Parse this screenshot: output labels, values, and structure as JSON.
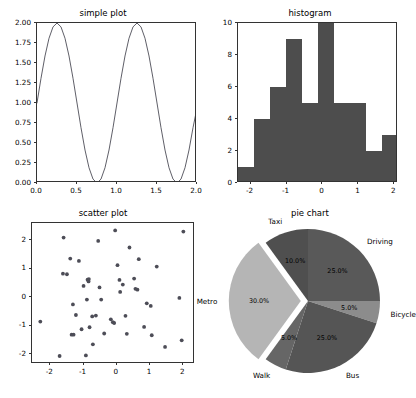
{
  "figure": {
    "width": 413,
    "height": 398,
    "background": "#ffffff"
  },
  "chart_data": [
    {
      "type": "line",
      "title": "simple plot",
      "xlabel": "",
      "ylabel": "",
      "xlim": [
        0,
        2
      ],
      "ylim": [
        0,
        2
      ],
      "xticks": [
        "0.0",
        "0.5",
        "1.0",
        "1.5",
        "2.0"
      ],
      "xtick_values": [
        0,
        0.5,
        1.0,
        1.5,
        2.0
      ],
      "yticks": [
        "0.00",
        "0.25",
        "0.50",
        "0.75",
        "1.00",
        "1.25",
        "1.50",
        "1.75",
        "2.00"
      ],
      "ytick_values": [
        0.0,
        0.25,
        0.5,
        0.75,
        1.0,
        1.25,
        1.5,
        1.75,
        2.0
      ],
      "grid": false,
      "legend": null,
      "line_color": "#4d4d57",
      "formula": "1 + sin(2*pi*x)",
      "x": [
        0.0,
        0.05,
        0.1,
        0.15,
        0.2,
        0.25,
        0.3,
        0.35,
        0.4,
        0.45,
        0.5,
        0.55,
        0.6,
        0.65,
        0.7,
        0.75,
        0.8,
        0.85,
        0.9,
        0.95,
        1.0,
        1.05,
        1.1,
        1.15,
        1.2,
        1.25,
        1.3,
        1.35,
        1.4,
        1.45,
        1.5,
        1.55,
        1.6,
        1.65,
        1.7,
        1.75,
        1.8,
        1.85,
        1.9,
        1.95,
        2.0
      ],
      "y": [
        1.0,
        1.309,
        1.588,
        1.809,
        1.951,
        2.0,
        1.951,
        1.809,
        1.588,
        1.309,
        1.0,
        0.691,
        0.412,
        0.191,
        0.049,
        0.0,
        0.049,
        0.191,
        0.412,
        0.691,
        1.0,
        1.309,
        1.588,
        1.809,
        1.951,
        2.0,
        1.951,
        1.809,
        1.588,
        1.309,
        1.0,
        0.691,
        0.412,
        0.191,
        0.049,
        0.0,
        0.049,
        0.191,
        0.412,
        0.691,
        0.938
      ]
    },
    {
      "type": "bar",
      "subtype": "histogram",
      "title": "histogram",
      "xlabel": "",
      "ylabel": "",
      "xlim": [
        -2.35,
        2.1
      ],
      "ylim": [
        0,
        10
      ],
      "xticks": [
        "-2",
        "-1",
        "0",
        "1",
        "2"
      ],
      "xtick_values": [
        -2,
        -1,
        0,
        1,
        2
      ],
      "yticks": [
        "0",
        "2",
        "4",
        "6",
        "8",
        "10"
      ],
      "ytick_values": [
        0,
        2,
        4,
        6,
        8,
        10
      ],
      "grid": false,
      "legend": null,
      "bar_color": "#4d4d4d",
      "bin_edges": [
        -2.35,
        -1.905,
        -1.46,
        -1.015,
        -0.57,
        -0.125,
        0.32,
        0.765,
        1.21,
        1.655,
        2.1
      ],
      "values": [
        1,
        4,
        6,
        9,
        5,
        10,
        5,
        5,
        2,
        3
      ]
    },
    {
      "type": "scatter",
      "title": "scatter plot",
      "xlabel": "",
      "ylabel": "",
      "xlim": [
        -2.55,
        2.35
      ],
      "ylim": [
        -2.35,
        2.6
      ],
      "xticks": [
        "-2",
        "-1",
        "0",
        "1",
        "2"
      ],
      "xtick_values": [
        -2,
        -1,
        0,
        1,
        2
      ],
      "yticks": [
        "-2",
        "-1",
        "0",
        "1",
        "2"
      ],
      "ytick_values": [
        -2,
        -1,
        0,
        1,
        2
      ],
      "grid": false,
      "legend": null,
      "marker_color": "#4d4d57",
      "points": [
        [
          -2.3,
          -0.86
        ],
        [
          -1.72,
          -2.07
        ],
        [
          -1.6,
          2.09
        ],
        [
          -1.62,
          0.82
        ],
        [
          -1.4,
          1.35
        ],
        [
          -1.36,
          -1.32
        ],
        [
          -1.3,
          -1.32
        ],
        [
          -1.32,
          -0.26
        ],
        [
          -1.23,
          -0.63
        ],
        [
          -1.14,
          1.27
        ],
        [
          -1.06,
          -1.13
        ],
        [
          -1.0,
          0.39
        ],
        [
          -0.93,
          -2.05
        ],
        [
          -0.9,
          -0.09
        ],
        [
          -0.88,
          0.61
        ],
        [
          -0.85,
          0.55
        ],
        [
          -0.84,
          0.63
        ],
        [
          -0.82,
          -1.06
        ],
        [
          -0.74,
          -0.68
        ],
        [
          -0.72,
          -1.66
        ],
        [
          -0.63,
          -0.65
        ],
        [
          -0.56,
          1.97
        ],
        [
          -0.52,
          0.34
        ],
        [
          -0.47,
          -0.09
        ],
        [
          -0.38,
          -1.28
        ],
        [
          -0.18,
          -0.78
        ],
        [
          -0.12,
          -0.88
        ],
        [
          -0.08,
          -0.91
        ],
        [
          -0.05,
          2.34
        ],
        [
          0.02,
          1.12
        ],
        [
          0.08,
          0.6
        ],
        [
          0.1,
          0.18
        ],
        [
          0.18,
          0.44
        ],
        [
          0.26,
          -0.66
        ],
        [
          0.3,
          -1.29
        ],
        [
          0.38,
          1.74
        ],
        [
          0.52,
          0.65
        ],
        [
          0.56,
          0.29
        ],
        [
          0.62,
          0.26
        ],
        [
          0.66,
          1.33
        ],
        [
          0.82,
          -1.05
        ],
        [
          0.9,
          -0.22
        ],
        [
          1.02,
          -0.31
        ],
        [
          1.05,
          -1.34
        ],
        [
          1.2,
          1.07
        ],
        [
          1.45,
          -1.75
        ],
        [
          1.88,
          -0.03
        ],
        [
          1.95,
          -1.52
        ],
        [
          2.0,
          2.3
        ],
        [
          -1.5,
          0.8
        ]
      ]
    },
    {
      "type": "pie",
      "title": "pie chart",
      "labels": [
        "Driving",
        "Bicycle",
        "Bus",
        "Walk",
        "Metro",
        "Taxi"
      ],
      "values": [
        25.0,
        5.0,
        25.0,
        5.0,
        30.0,
        10.0
      ],
      "autopct": [
        "25.0%",
        "5.0%",
        "25.0%",
        "5.0%",
        "30.0%",
        "10.0%"
      ],
      "explode": [
        0,
        0,
        0,
        0,
        0.1,
        0
      ],
      "startangle": 90,
      "counterclock": false,
      "colors": [
        "#595959",
        "#8c8c8c",
        "#555555",
        "#666666",
        "#b5b5b5",
        "#4f4f4f"
      ],
      "legend": null,
      "grid": false
    }
  ]
}
